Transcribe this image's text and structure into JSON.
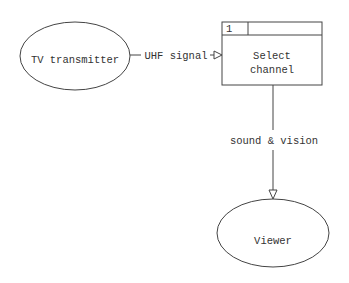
{
  "diagram": {
    "type": "data-flow-diagram",
    "external_entities": [
      {
        "id": "tv-transmitter",
        "label": "TV transmitter"
      },
      {
        "id": "viewer",
        "label": "Viewer"
      }
    ],
    "processes": [
      {
        "id": "select-channel",
        "number": "1",
        "label_line1": "Select",
        "label_line2": "channel"
      }
    ],
    "flows": [
      {
        "from": "tv-transmitter",
        "to": "select-channel",
        "label": "UHF signal"
      },
      {
        "from": "select-channel",
        "to": "viewer",
        "label": "sound & vision"
      }
    ],
    "colors": {
      "stroke": "#444444",
      "text": "#333333",
      "background": "#ffffff"
    }
  }
}
